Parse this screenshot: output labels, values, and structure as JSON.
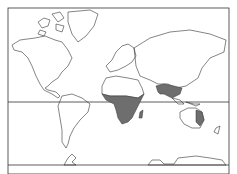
{
  "map": {
    "type": "world-distribution-map",
    "projection": "mercator",
    "colors": {
      "background": "#ffffff",
      "outline": "#333333",
      "shaded": "#6e6e6e"
    },
    "shaded_regions": [
      "sub-saharan-africa",
      "madagascar",
      "india",
      "southeast-asia",
      "eastern-australia"
    ]
  }
}
